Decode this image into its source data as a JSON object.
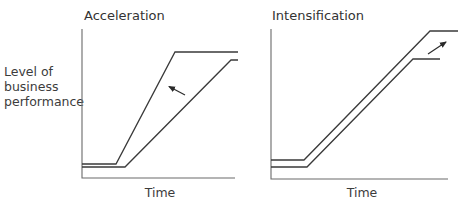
{
  "y_axis_label": [
    "Level of",
    "business",
    "performance"
  ],
  "panels": [
    {
      "title": "Acceleration",
      "x_label": "Time",
      "curves": [
        {
          "name": "new-path",
          "points": [
            [
              82,
              164
            ],
            [
              116,
              164
            ],
            [
              175,
              52
            ],
            [
              238,
              52
            ]
          ]
        },
        {
          "name": "original-path",
          "points": [
            [
              82,
              167
            ],
            [
              125,
              167
            ],
            [
              231,
              60
            ],
            [
              238,
              60
            ]
          ]
        }
      ],
      "arrow": {
        "from": [
          185,
          95
        ],
        "to": [
          168,
          86
        ],
        "meaning": "shift left (faster)"
      }
    },
    {
      "title": "Intensification",
      "x_label": "Time",
      "curves": [
        {
          "name": "new-path",
          "points": [
            [
              271,
              160
            ],
            [
              304,
              160
            ],
            [
              430,
              31
            ],
            [
              458,
              31
            ]
          ]
        },
        {
          "name": "original-path",
          "points": [
            [
              271,
              167
            ],
            [
              307,
              167
            ],
            [
              413,
              59
            ],
            [
              440,
              59
            ]
          ]
        }
      ],
      "arrow": {
        "from": [
          428,
          54
        ],
        "to": [
          447,
          41
        ],
        "meaning": "shift up (higher)"
      }
    }
  ]
}
